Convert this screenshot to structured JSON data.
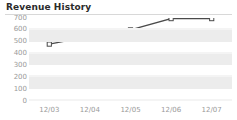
{
  "header": {
    "title": "Revenue History"
  },
  "chart_data": {
    "type": "line",
    "title": "Revenue History",
    "xlabel": "",
    "ylabel": "",
    "categories": [
      "12/03",
      "12/04",
      "12/05",
      "12/06",
      "12/07"
    ],
    "values": [
      480,
      545,
      600,
      695,
      695
    ],
    "series": [
      {
        "name": "Revenue",
        "values": [
          480,
          545,
          600,
          695,
          695
        ]
      }
    ],
    "ylim": [
      0,
      700
    ],
    "yticks": [
      700,
      600,
      500,
      400,
      300,
      200,
      100,
      0
    ],
    "ytick_labels": [
      "700",
      "600",
      "500",
      "400",
      "300",
      "200",
      "100",
      "0"
    ],
    "grid": true,
    "grid_style": "alternating-bands",
    "legend": false,
    "legend_position": "none",
    "marker": "open-square",
    "line_color": "#4a4a4a",
    "marker_fill": "#ffffff",
    "marker_stroke": "#4a4a4a",
    "band_color": "#ececec",
    "plot_background": "#ffffff",
    "axis_label_color": "#9a9a9a",
    "title_color": "#2b2b2b",
    "rule_color": "#d8d8d8"
  }
}
